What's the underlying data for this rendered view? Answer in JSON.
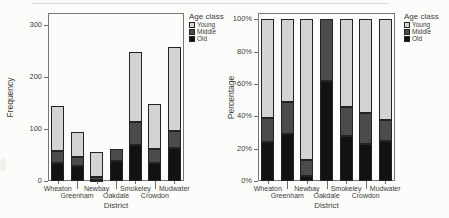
{
  "figure": {
    "legend": {
      "title": "Age class",
      "entries": [
        {
          "label": "Young",
          "color": "#d3d3d1"
        },
        {
          "label": "Middle",
          "color": "#4b4b4d"
        },
        {
          "label": "Old",
          "color": "#111214"
        }
      ]
    }
  },
  "chart_data": [
    {
      "type": "bar",
      "stacked": true,
      "title": "",
      "xlabel": "District",
      "ylabel": "Frequency",
      "categories": [
        "Wheaton",
        "Greenham",
        "Newbay",
        "Oakdale",
        "Smokeley",
        "Crowdon",
        "Mudwater"
      ],
      "series": [
        {
          "name": "Old",
          "color": "#111214",
          "values": [
            35,
            28,
            2,
            39,
            70,
            35,
            64
          ]
        },
        {
          "name": "Middle",
          "color": "#4b4b4d",
          "values": [
            22,
            18,
            5,
            23,
            44,
            26,
            33
          ]
        },
        {
          "name": "Young",
          "color": "#d3d3d1",
          "values": [
            88,
            49,
            48,
            0,
            134,
            87,
            161
          ]
        }
      ],
      "stack_order": "bottom-to-top: Old, Middle, Young",
      "totals": [
        145,
        95,
        55,
        62,
        248,
        148,
        258
      ],
      "ylim": [
        0,
        300
      ],
      "yticks": [
        0,
        100,
        200,
        300
      ],
      "ytick_labels": [
        "0",
        "100",
        "200",
        "300"
      ],
      "legend_title": "Age class",
      "legend_position": "right",
      "grid": false
    },
    {
      "type": "bar",
      "stacked": true,
      "title": "",
      "xlabel": "District",
      "ylabel": "Percentage",
      "categories": [
        "Wheaton",
        "Greenham",
        "Newbay",
        "Oakdale",
        "Smokeley",
        "Crowdon",
        "Mudwater"
      ],
      "series": [
        {
          "name": "Old",
          "color": "#111214",
          "values": [
            24,
            29,
            3,
            62,
            28,
            23,
            25
          ]
        },
        {
          "name": "Middle",
          "color": "#4b4b4d",
          "values": [
            15,
            20,
            10,
            38,
            18,
            19,
            13
          ]
        },
        {
          "name": "Young",
          "color": "#d3d3d1",
          "values": [
            61,
            51,
            87,
            0,
            54,
            58,
            62
          ]
        }
      ],
      "stack_order": "bottom-to-top: Old, Middle, Young",
      "ylim": [
        0,
        100
      ],
      "yticks": [
        0,
        20,
        40,
        60,
        80,
        100
      ],
      "ytick_labels": [
        "0%",
        "20%",
        "40%",
        "60%",
        "80%",
        "100%"
      ],
      "legend_title": "Age class",
      "legend_position": "right",
      "grid": false
    }
  ]
}
